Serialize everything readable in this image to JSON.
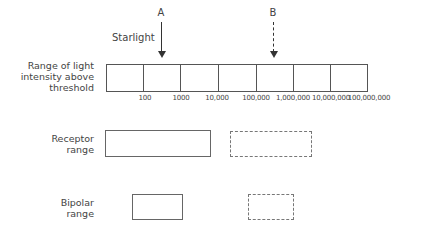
{
  "figure": {
    "arrows": [
      {
        "letter": "A",
        "annotation": "Starlight",
        "style": "solid"
      },
      {
        "letter": "B",
        "annotation": "",
        "style": "dashed"
      }
    ],
    "scale": {
      "label_lines": [
        "Range of light",
        "intensity above",
        "threshold"
      ],
      "ticks": [
        "100",
        "1000",
        "10,000",
        "100,000",
        "1,000,000",
        "10,000,000",
        "100,000,000"
      ]
    },
    "rows": [
      {
        "label_lines": [
          "Receptor",
          "range"
        ],
        "solid_box": "receptor range (A)",
        "dashed_box": "receptor range (B)"
      },
      {
        "label_lines": [
          "Bipolar",
          "range"
        ],
        "solid_box": "bipolar range (A)",
        "dashed_box": "bipolar range (B)"
      }
    ]
  }
}
